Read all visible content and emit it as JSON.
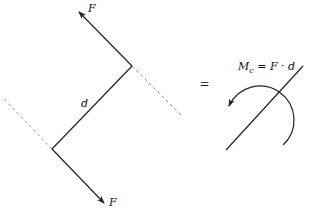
{
  "diagram": {
    "left": {
      "force_top_label": "F",
      "force_bottom_label": "F",
      "distance_label": "d"
    },
    "equals_sign": "=",
    "right": {
      "moment_label_main": "M",
      "moment_label_sub": "c",
      "moment_label_rest": " = F · d"
    },
    "colors": {
      "line": "#222222",
      "dashed": "#9a9a9a"
    }
  }
}
